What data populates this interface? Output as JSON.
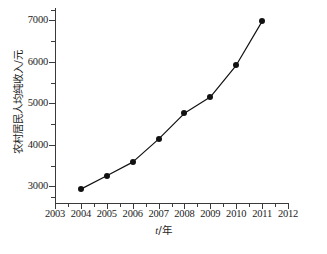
{
  "chart_data": {
    "type": "line",
    "title": "",
    "xlabel": "t/年",
    "ylabel": "农村居民人均纯收入/元",
    "x": [
      2004,
      2005,
      2006,
      2007,
      2008,
      2009,
      2010,
      2011
    ],
    "values": [
      2936,
      3255,
      3587,
      4140,
      4761,
      5153,
      5919,
      6977
    ],
    "series": [
      {
        "name": "农村居民人均纯收入",
        "values": [
          2936,
          3255,
          3587,
          4140,
          4761,
          5153,
          5919,
          6977
        ]
      }
    ],
    "xlim": [
      2003,
      2012
    ],
    "ylim": [
      2600,
      7300
    ],
    "xticks": [
      2003,
      2004,
      2005,
      2006,
      2007,
      2008,
      2009,
      2010,
      2011,
      2012
    ],
    "xtick_labels": [
      "2003",
      "2004",
      "2005",
      "2006",
      "2007",
      "2008",
      "2009",
      "2010",
      "2011",
      "2012"
    ],
    "yticks": [
      3000,
      4000,
      5000,
      6000,
      7000
    ],
    "ytick_labels": [
      "3000",
      "4000",
      "5000",
      "6000",
      "7000"
    ],
    "y_minor_ticks": [
      2750,
      3500,
      4500,
      5500,
      6500,
      7250
    ],
    "x_minor_ticks": [
      2003.5,
      2004.5,
      2005.5,
      2006.5,
      2007.5,
      2008.5,
      2009.5,
      2010.5,
      2011.5
    ],
    "grid": false,
    "legend": null,
    "legend_position": "none",
    "marker": "filled-circle",
    "line_color": "#111111",
    "marker_color": "#111111",
    "background_color": "#ffffff",
    "spines": [
      "left",
      "bottom"
    ]
  },
  "axis": {
    "x_title_variable": "t",
    "x_title_separator": "/",
    "x_title_unit": "年",
    "y_title": "农村居民人均纯收入/元"
  },
  "caption": {
    "text": "",
    "clipped": true
  }
}
